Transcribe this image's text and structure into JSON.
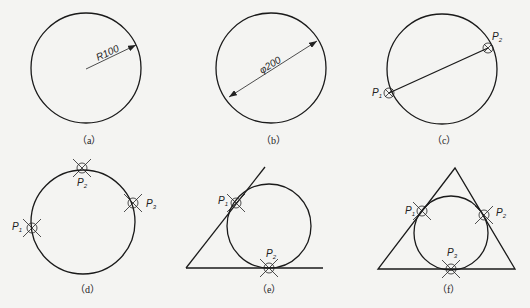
{
  "figure": {
    "panels": [
      {
        "id": "a",
        "caption": "（a）",
        "description": "Circle by center and radius",
        "dimension": "R100"
      },
      {
        "id": "b",
        "caption": "（b）",
        "description": "Circle by center and diameter",
        "dimension": "φ200"
      },
      {
        "id": "c",
        "caption": "（c）",
        "description": "Circle by two points",
        "points": [
          "P1",
          "P2"
        ]
      },
      {
        "id": "d",
        "caption": "（d）",
        "description": "Circle by three points",
        "points": [
          "P1",
          "P2",
          "P3"
        ]
      },
      {
        "id": "e",
        "caption": "（e）",
        "description": "Circle tangent to two lines (tan-tan-radius)",
        "points": [
          "P1",
          "P2"
        ]
      },
      {
        "id": "f",
        "caption": "（f）",
        "description": "Circle tangent to three lines",
        "points": [
          "P1",
          "P2",
          "P3"
        ]
      }
    ]
  },
  "labels": {
    "a_dim": "R100",
    "b_dim": "φ200",
    "c_p1": "P",
    "c_p1_sub": "1",
    "c_p2": "P",
    "c_p2_sub": "2",
    "d_p1": "P",
    "d_p1_sub": "1",
    "d_p2": "P",
    "d_p2_sub": "2",
    "d_p3": "P",
    "d_p3_sub": "3",
    "e_p1": "P",
    "e_p1_sub": "1",
    "e_p2": "P",
    "e_p2_sub": "2",
    "f_p1": "P",
    "f_p1_sub": "1",
    "f_p2": "P",
    "f_p2_sub": "2",
    "f_p3": "P",
    "f_p3_sub": "3"
  }
}
